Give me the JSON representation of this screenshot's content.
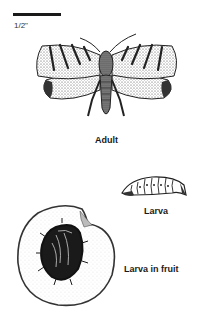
{
  "scale_bar": {
    "label": "1/2\""
  },
  "figures": [
    {
      "id": "adult",
      "label": "Adult"
    },
    {
      "id": "larva",
      "label": "Larva"
    },
    {
      "id": "larva-in-fruit",
      "label": "Larva in fruit"
    }
  ],
  "colors": {
    "ink": "#1a1a1a",
    "stipple": "#555555",
    "paper": "#ffffff"
  }
}
